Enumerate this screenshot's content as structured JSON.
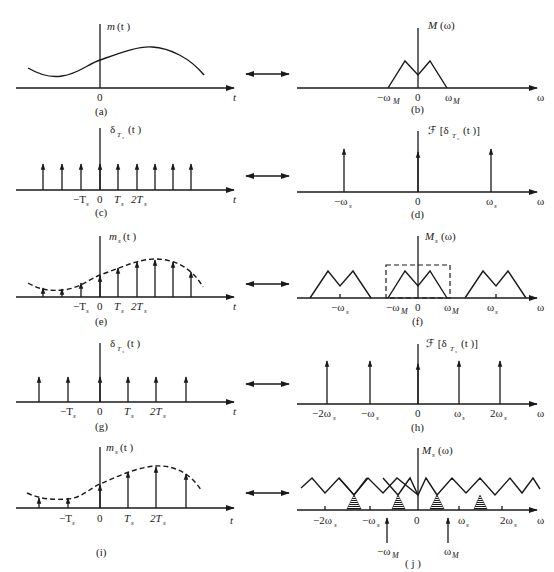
{
  "figure": {
    "panels": [
      {
        "id": "a",
        "caption": "(a)",
        "ylabel": "m (t)",
        "xlabel": "t",
        "ticks": [
          "0"
        ],
        "description": "Continuous message signal m(t)"
      },
      {
        "id": "b",
        "caption": "(b)",
        "ylabel": "M (ω)",
        "xlabel": "ω",
        "ticks": [
          "−ωM",
          "0",
          "ωM"
        ],
        "description": "Band-limited spectrum M(ω)"
      },
      {
        "id": "c",
        "caption": "(c)",
        "ylabel": "δTs (t)",
        "xlabel": "t",
        "ticks": [
          "−Ts",
          "0",
          "Ts",
          "2Ts"
        ],
        "description": "Impulse train with period Ts"
      },
      {
        "id": "d",
        "caption": "(d)",
        "ylabel": "ℱ [δTs (t )]",
        "xlabel": "ω",
        "ticks": [
          "−ωs",
          "0",
          "ωs"
        ],
        "description": "Spectrum of impulse train"
      },
      {
        "id": "e",
        "caption": "(e)",
        "ylabel": "ms (t )",
        "xlabel": "t",
        "ticks": [
          "−Ts",
          "0",
          "Ts",
          "2Ts"
        ],
        "description": "Sampled signal"
      },
      {
        "id": "f",
        "caption": "(f)",
        "ylabel": "Ms (ω)",
        "xlabel": "ω",
        "ticks": [
          "−ωs",
          "−ωM",
          "0",
          "ωM",
          "ωs"
        ],
        "description": "Spectrum of sampled signal (no aliasing)"
      },
      {
        "id": "g",
        "caption": "(g)",
        "ylabel": "δTs (t )",
        "xlabel": "t",
        "ticks": [
          "−Ts",
          "0",
          "Ts",
          "2Ts"
        ],
        "description": "Impulse train with larger period Ts"
      },
      {
        "id": "h",
        "caption": "(h)",
        "ylabel": "ℱ [δTs (t )]",
        "xlabel": "ω",
        "ticks": [
          "−2ωs",
          "−ωs",
          "0",
          "ωs",
          "2ωs"
        ],
        "description": "Spectrum of impulse train"
      },
      {
        "id": "i",
        "caption": "(i)",
        "ylabel": "ms (t )",
        "xlabel": "t",
        "ticks": [
          "−Ts",
          "0",
          "Ts",
          "2Ts"
        ],
        "description": "Undersampled signal"
      },
      {
        "id": "j",
        "caption": "( j )",
        "ylabel": "Ms (ω)",
        "xlabel": "ω",
        "ticks": [
          "−2ωs",
          "−ωs",
          "0",
          "ωs",
          "2ωs"
        ],
        "annotations": [
          "−ωM",
          "ωM"
        ],
        "description": "Spectrum with aliasing (overlapping shaded regions)"
      }
    ],
    "connector": "↔"
  },
  "labels": {
    "a_y_m": "m",
    "a_y_arg": "(t )",
    "a_x": "t",
    "a_0": "0",
    "a_cap": "(a)",
    "b_y_M": "M",
    "b_y_arg": "(ω)",
    "b_x": "ω",
    "b_nwm": "−ω",
    "b_0": "0",
    "b_wm": "ω",
    "b_sub": "M",
    "b_cap": "(b)",
    "c_y": "δ",
    "c_ysub": "T",
    "c_ysub2": "s",
    "c_yarg": "(t )",
    "c_x": "t",
    "c_nT": "−T",
    "c_0": "0",
    "c_T": "T",
    "c_2T": "2T",
    "c_s": "s",
    "c_cap": "(c)",
    "d_y": "ℱ [δ",
    "d_ysub": "T",
    "d_ysub2": "s",
    "d_yarg": "(t )]",
    "d_x": "ω",
    "d_nws": "−ω",
    "d_0": "0",
    "d_ws": "ω",
    "d_s": "s",
    "d_cap": "(d)",
    "e_y": "m",
    "e_ysub": "s",
    "e_yarg": "(t )",
    "e_x": "t",
    "e_nT": "−T",
    "e_0": "0",
    "e_T": "T",
    "e_2T": "2T",
    "e_s": "s",
    "e_cap": "(e)",
    "f_y": "M",
    "f_ysub": "s",
    "f_yarg": "(ω)",
    "f_x": "ω",
    "f_nws": "−ω",
    "f_nwm": "−ω",
    "f_0": "0",
    "f_wm": "ω",
    "f_ws": "ω",
    "f_s": "s",
    "f_M": "M",
    "f_cap": "(f)",
    "g_y": "δ",
    "g_ysub": "T",
    "g_ysub2": "s",
    "g_yarg": "(t )",
    "g_x": "t",
    "g_nT": "−T",
    "g_0": "0",
    "g_T": "T",
    "g_2T": "2T",
    "g_s": "s",
    "g_cap": "(g)",
    "h_y": "ℱ [δ",
    "h_ysub": "T",
    "h_ysub2": "s",
    "h_yarg": "(t )]",
    "h_x": "ω",
    "h_n2ws": "−2ω",
    "h_nws": "−ω",
    "h_0": "0",
    "h_ws": "ω",
    "h_2ws": "2ω",
    "h_s": "s",
    "h_cap": "(h)",
    "i_y": "m",
    "i_ysub": "s",
    "i_yarg": "(t )",
    "i_x": "t",
    "i_nT": "−T",
    "i_0": "0",
    "i_T": "T",
    "i_2T": "2T",
    "i_s": "s",
    "i_cap": "(i)",
    "j_y": "M",
    "j_ysub": "s",
    "j_yarg": "(ω)",
    "j_x": "ω",
    "j_n2ws": "−2ω",
    "j_nws": "−ω",
    "j_0": "0",
    "j_ws": "ω",
    "j_2ws": "2ω",
    "j_s": "s",
    "j_nwm": "−ω",
    "j_wm": "ω",
    "j_M": "M",
    "j_cap": "( j )"
  }
}
